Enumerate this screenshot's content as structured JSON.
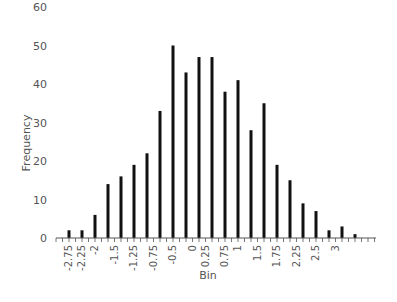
{
  "chart_data": {
    "type": "bar",
    "title": "",
    "xlabel": "Bin",
    "ylabel": "Frequency",
    "ylim": [
      0,
      60
    ],
    "yticks": [
      0,
      10,
      20,
      30,
      40,
      50,
      60
    ],
    "grid": false,
    "legend": null,
    "categories": [
      -2.75,
      -2.5,
      -2.25,
      -2,
      -1.75,
      -1.5,
      -1.25,
      -1,
      -0.75,
      -0.5,
      -0.25,
      0,
      0.25,
      0.5,
      0.75,
      1,
      1.25,
      1.5,
      1.75,
      2,
      2.25,
      2.5,
      2.75
    ],
    "values": [
      2,
      2,
      6,
      14,
      16,
      19,
      22,
      33,
      50,
      43,
      47,
      47,
      38,
      41,
      28,
      35,
      19,
      15,
      9,
      7,
      2,
      3,
      1
    ],
    "visible_tick_labels": [
      "-2.75",
      "-2.25",
      "-2",
      "-1.5",
      "-1.25",
      "-0.75",
      "-0.5",
      "0",
      "0.25",
      "0.75",
      "1",
      "1.5",
      "1.75",
      "2.25",
      "2.5",
      "3"
    ]
  },
  "axes": {
    "x_title": "Bin",
    "y_title": "Frequency"
  }
}
